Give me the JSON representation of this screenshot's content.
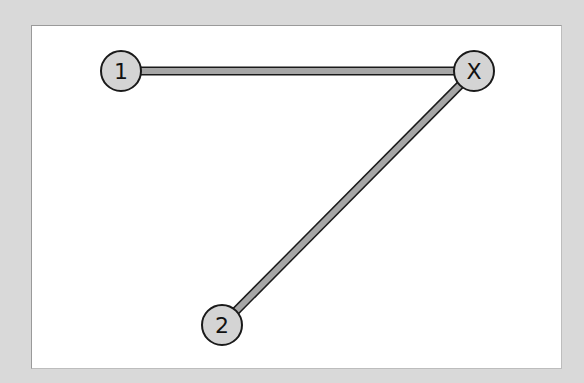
{
  "diagram": {
    "nodes": [
      {
        "id": "1",
        "label": "1",
        "x": 121,
        "y": 71
      },
      {
        "id": "X",
        "label": "X",
        "x": 474,
        "y": 71
      },
      {
        "id": "2",
        "label": "2",
        "x": 222,
        "y": 325
      }
    ],
    "edges": [
      {
        "from": "1",
        "to": "X"
      },
      {
        "from": "2",
        "to": "X"
      }
    ],
    "colors": {
      "background": "#d9d9d9",
      "panel": "#ffffff",
      "node_fill": "#d4d4d4",
      "edge_fill": "#a6a6a6",
      "stroke": "#1a1a1a"
    }
  }
}
